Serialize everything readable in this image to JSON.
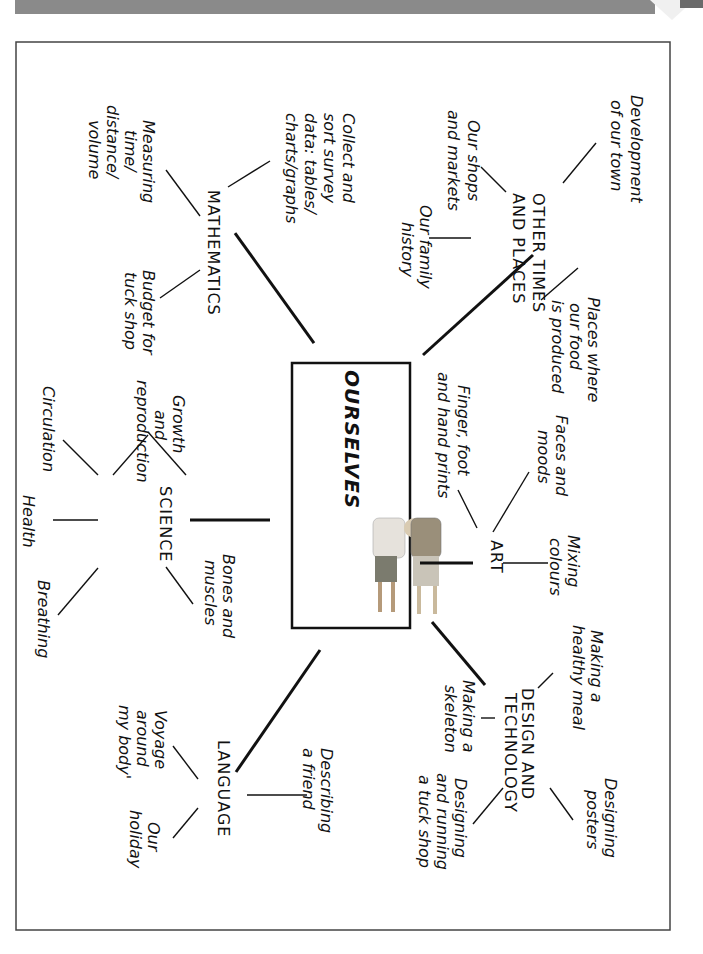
{
  "page": {
    "orientation": "rotated 90 degrees clockwise",
    "frame_color": "#444444",
    "header_bar_color": "#8a8a8a"
  },
  "center": {
    "title": "OURSELVES",
    "image": "two-children-photo"
  },
  "topics": {
    "other_times": {
      "heading_line1": "OTHER TIMES",
      "heading_line2": "AND PLACES",
      "items": [
        {
          "lines": [
            "Development",
            "of our town"
          ]
        },
        {
          "lines": [
            "Our shops",
            "and markets"
          ]
        },
        {
          "lines": [
            "Our family",
            "history"
          ]
        },
        {
          "lines": [
            "Places where",
            "our food",
            "is produced"
          ]
        }
      ]
    },
    "mathematics": {
      "heading": "MATHEMATICS",
      "items": [
        {
          "lines": [
            "Collect and",
            "sort survey",
            "data: tables/",
            "charts/graphs"
          ]
        },
        {
          "lines": [
            "Measuring",
            "time/",
            "distance/",
            "volume"
          ]
        },
        {
          "lines": [
            "Budget for",
            "tuck shop"
          ]
        }
      ]
    },
    "art": {
      "heading": "ART",
      "items": [
        {
          "lines": [
            "Faces and",
            "moods"
          ]
        },
        {
          "lines": [
            "Finger, foot",
            "and hand prints"
          ]
        },
        {
          "lines": [
            "Mixing",
            "colours"
          ]
        }
      ]
    },
    "science": {
      "heading": "SCIENCE",
      "items": [
        {
          "lines": [
            "Growth",
            "and",
            "reproduction"
          ]
        },
        {
          "lines": [
            "Circulation"
          ]
        },
        {
          "lines": [
            "Health"
          ]
        },
        {
          "lines": [
            "Breathing"
          ]
        },
        {
          "lines": [
            "Bones and",
            "muscles"
          ]
        }
      ]
    },
    "design_technology": {
      "heading_line1": "DESIGN AND",
      "heading_line2": "TECHNOLOGY",
      "items": [
        {
          "lines": [
            "Making a",
            "healthy meal"
          ]
        },
        {
          "lines": [
            "Making a",
            "skeleton"
          ]
        },
        {
          "lines": [
            "Designing",
            "posters"
          ]
        },
        {
          "lines": [
            "Designing",
            "and running",
            "a tuck shop"
          ]
        }
      ]
    },
    "language": {
      "heading": "LANGUAGE",
      "items": [
        {
          "lines": [
            "Describing",
            "a friend"
          ]
        },
        {
          "lines": [
            "Voyage",
            "around",
            "my body'"
          ]
        },
        {
          "lines": [
            "Our",
            "holiday"
          ]
        }
      ]
    }
  }
}
